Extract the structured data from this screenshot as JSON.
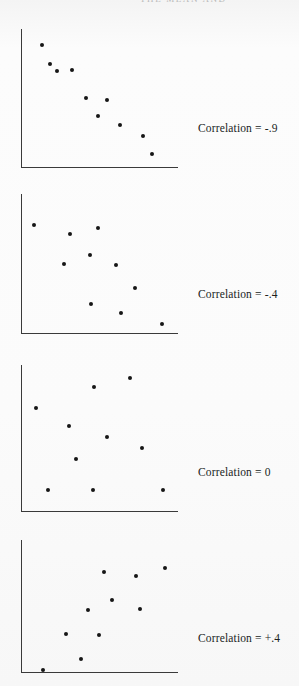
{
  "page": {
    "background_color": "#fbfbfb",
    "ink_color": "#161616",
    "axis_color": "#3a3a3a",
    "running_head": "THE MEAN AND"
  },
  "chart_data": [
    {
      "type": "scatter",
      "title": "Correlation = -.9",
      "label": "Correlation = -.9",
      "correlation": -0.9,
      "xlabel": "",
      "ylabel": "",
      "grid": false,
      "axes": {
        "x_min": 21,
        "x_max": 178,
        "y_min": 29,
        "y_max": 167
      },
      "points": [
        {
          "x": 42,
          "y": 45
        },
        {
          "x": 50,
          "y": 64
        },
        {
          "x": 57,
          "y": 71
        },
        {
          "x": 72,
          "y": 70
        },
        {
          "x": 86,
          "y": 98
        },
        {
          "x": 107,
          "y": 100
        },
        {
          "x": 98,
          "y": 116
        },
        {
          "x": 120,
          "y": 125
        },
        {
          "x": 143,
          "y": 136
        },
        {
          "x": 152,
          "y": 154
        }
      ]
    },
    {
      "type": "scatter",
      "title": "Correlation = -.4",
      "label": "Correlation = -.4",
      "correlation": -0.4,
      "xlabel": "",
      "ylabel": "",
      "grid": false,
      "axes": {
        "x_min": 21,
        "x_max": 178,
        "y_min": 194,
        "y_max": 333
      },
      "points": [
        {
          "x": 34,
          "y": 225
        },
        {
          "x": 70,
          "y": 234
        },
        {
          "x": 98,
          "y": 228
        },
        {
          "x": 90,
          "y": 255
        },
        {
          "x": 64,
          "y": 264
        },
        {
          "x": 116,
          "y": 265
        },
        {
          "x": 135,
          "y": 288
        },
        {
          "x": 91,
          "y": 304
        },
        {
          "x": 121,
          "y": 313
        },
        {
          "x": 162,
          "y": 324
        }
      ]
    },
    {
      "type": "scatter",
      "title": "Correlation = 0",
      "label": "Correlation = 0",
      "correlation": 0,
      "xlabel": "",
      "ylabel": "",
      "grid": false,
      "axes": {
        "x_min": 21,
        "x_max": 178,
        "y_min": 365,
        "y_max": 511
      },
      "points": [
        {
          "x": 130,
          "y": 378
        },
        {
          "x": 94,
          "y": 387
        },
        {
          "x": 36,
          "y": 408
        },
        {
          "x": 69,
          "y": 426
        },
        {
          "x": 107,
          "y": 437
        },
        {
          "x": 142,
          "y": 448
        },
        {
          "x": 76,
          "y": 459
        },
        {
          "x": 48,
          "y": 490
        },
        {
          "x": 93,
          "y": 490
        },
        {
          "x": 163,
          "y": 490
        }
      ]
    },
    {
      "type": "scatter",
      "title": "Correlation = +.4",
      "label": "Correlation = +.4",
      "correlation": 0.4,
      "xlabel": "",
      "ylabel": "",
      "grid": false,
      "axes": {
        "x_min": 21,
        "x_max": 178,
        "y_min": 540,
        "y_max": 672
      },
      "points": [
        {
          "x": 165,
          "y": 568
        },
        {
          "x": 104,
          "y": 572
        },
        {
          "x": 136,
          "y": 576
        },
        {
          "x": 112,
          "y": 600
        },
        {
          "x": 88,
          "y": 610
        },
        {
          "x": 140,
          "y": 609
        },
        {
          "x": 66,
          "y": 634
        },
        {
          "x": 99,
          "y": 635
        },
        {
          "x": 81,
          "y": 659
        },
        {
          "x": 43,
          "y": 670
        }
      ]
    }
  ],
  "labels": {
    "panel_1": "Correlation = -.9",
    "panel_2": "Correlation = -.4",
    "panel_3": "Correlation = 0",
    "panel_4": "Correlation = +.4"
  },
  "label_positions": [
    {
      "left": 198,
      "top": 122
    },
    {
      "left": 198,
      "top": 288
    },
    {
      "left": 198,
      "top": 466
    },
    {
      "left": 198,
      "top": 632
    }
  ]
}
